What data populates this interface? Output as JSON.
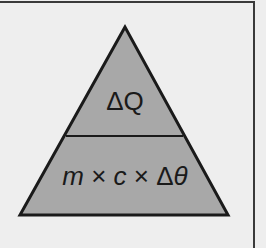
{
  "diagram": {
    "colors": {
      "background": "#eeeeee",
      "triangle_fill": "#a8a8a8",
      "outline": "#1a1a1a",
      "frame": "#3a3a3a"
    },
    "triangle": {
      "apex": [
        125,
        27
      ],
      "base_left": [
        20,
        215
      ],
      "base_right": [
        228,
        215
      ],
      "divider_y": 136
    },
    "top_section": {
      "delta": "Δ",
      "symbol": "Q"
    },
    "bottom_section": {
      "m": "m",
      "times1": " × ",
      "c": "c",
      "times2": " × ",
      "delta": "Δ",
      "theta": "θ"
    }
  }
}
